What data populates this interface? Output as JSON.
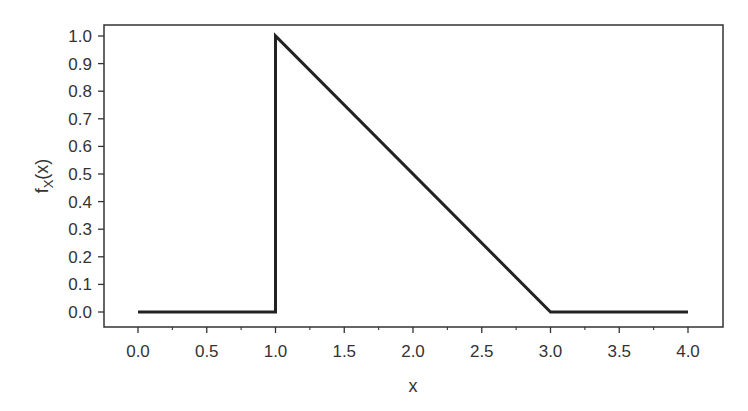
{
  "chart_data": {
    "type": "line",
    "title": "",
    "xlabel": "x",
    "ylabel": "f_X(x)",
    "ylabel_main": "f",
    "ylabel_sub": "X",
    "ylabel_tail": "(x)",
    "xlim": [
      -0.25,
      4.25
    ],
    "ylim": [
      -0.05,
      1.05
    ],
    "xticks": [
      "0.0",
      "0.5",
      "1.0",
      "1.5",
      "2.0",
      "2.5",
      "3.0",
      "3.5",
      "4.0"
    ],
    "yticks": [
      "0.0",
      "0.1",
      "0.2",
      "0.3",
      "0.4",
      "0.5",
      "0.6",
      "0.7",
      "0.8",
      "0.9",
      "1.0"
    ],
    "grid": false,
    "legend": null,
    "series": [
      {
        "name": "f_X(x)",
        "x": [
          0.0,
          1.0,
          1.0,
          3.0,
          4.0
        ],
        "y": [
          0.0,
          0.0,
          1.0,
          0.0,
          0.0
        ]
      }
    ]
  }
}
